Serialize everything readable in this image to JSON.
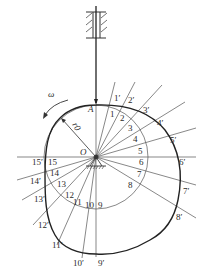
{
  "diagram": {
    "title": "",
    "type": "cam profile construction (reversal method, translating knife-edge follower)",
    "labels": {
      "center": "O",
      "start_point": "A",
      "angular_velocity": "ω",
      "base_radius": "r0"
    },
    "inner_points": [
      "1",
      "2",
      "3",
      "4",
      "5",
      "6",
      "7",
      "8",
      "9",
      "10",
      "11",
      "12",
      "13",
      "14",
      "15"
    ],
    "outer_points": [
      "1′",
      "2′",
      "3′",
      "4′",
      "5′",
      "6′",
      "7′",
      "8′",
      "9′",
      "10′",
      "11′",
      "12′",
      "13′",
      "14′",
      "15′"
    ],
    "colors": {
      "line": "#555555",
      "profile": "#222222",
      "text": "#2a2a2a",
      "background": "#ffffff"
    }
  }
}
